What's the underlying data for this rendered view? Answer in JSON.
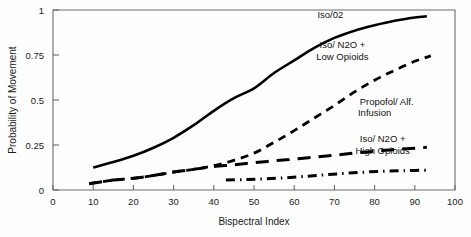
{
  "chart_data": {
    "type": "line",
    "title": "",
    "xlabel": "Bispectral Index",
    "ylabel": "Probability of Movement",
    "xlim": [
      0,
      100
    ],
    "ylim": [
      0,
      1
    ],
    "xticks": [
      0,
      10,
      20,
      30,
      40,
      50,
      60,
      70,
      80,
      90,
      100
    ],
    "xticklabels": [
      "0",
      "10",
      "20",
      "30",
      "40",
      "50",
      "60",
      "70",
      "80",
      "90",
      "100"
    ],
    "yticks": [
      0,
      0.25,
      0.5,
      0.75,
      1
    ],
    "yticklabels": [
      "0",
      "0.25",
      "0.5",
      "0.75",
      "1"
    ],
    "grid": false,
    "legend": "inline-annotations",
    "series": [
      {
        "name": "Iso/02",
        "linestyle": "solid",
        "color": "#000000",
        "label_lines": [
          "Iso/02"
        ],
        "x": [
          10,
          15,
          20,
          25,
          30,
          35,
          40,
          45,
          50,
          55,
          60,
          65,
          70,
          75,
          80,
          85,
          90,
          93
        ],
        "y": [
          0.125,
          0.155,
          0.19,
          0.235,
          0.29,
          0.36,
          0.44,
          0.51,
          0.565,
          0.65,
          0.72,
          0.79,
          0.845,
          0.885,
          0.915,
          0.94,
          0.958,
          0.965
        ]
      },
      {
        "name": "Iso/ N2O + Low Opioids",
        "linestyle": "dashed",
        "color": "#000000",
        "label_lines": [
          "Iso/ N2O +",
          "Low Opioids"
        ],
        "x": [
          9,
          15,
          20,
          25,
          30,
          35,
          40,
          45,
          50,
          55,
          60,
          65,
          70,
          75,
          80,
          85,
          90,
          94
        ],
        "y": [
          0.035,
          0.055,
          0.065,
          0.08,
          0.1,
          0.115,
          0.135,
          0.165,
          0.205,
          0.265,
          0.33,
          0.4,
          0.47,
          0.545,
          0.61,
          0.665,
          0.715,
          0.745
        ]
      },
      {
        "name": "Propofol/ Alf. Infusion",
        "linestyle": "longdash",
        "color": "#000000",
        "label_lines": [
          "Propofol/ Alf.",
          "Infusion"
        ],
        "x": [
          9,
          15,
          20,
          25,
          30,
          35,
          40,
          45,
          50,
          55,
          60,
          65,
          70,
          75,
          80,
          85,
          90,
          93
        ],
        "y": [
          0.035,
          0.055,
          0.065,
          0.08,
          0.1,
          0.115,
          0.13,
          0.14,
          0.152,
          0.162,
          0.172,
          0.182,
          0.193,
          0.205,
          0.215,
          0.225,
          0.232,
          0.237
        ]
      },
      {
        "name": "Iso/ N2O + High Opioids",
        "linestyle": "dashdot",
        "color": "#000000",
        "label_lines": [
          "Iso/ N2O +",
          "High Opioids"
        ],
        "x": [
          43,
          48,
          53,
          58,
          63,
          68,
          73,
          78,
          83,
          88,
          93
        ],
        "y": [
          0.055,
          0.058,
          0.062,
          0.068,
          0.076,
          0.085,
          0.093,
          0.1,
          0.105,
          0.108,
          0.11
        ]
      }
    ],
    "annotations": [
      {
        "text": "Iso/02",
        "x": 69,
        "y": 0.955
      },
      {
        "text": "Iso/ N2O +",
        "x": 72,
        "y": 0.79
      },
      {
        "text": "Low Opioids",
        "x": 72,
        "y": 0.725
      },
      {
        "text": "Propofol/ Alf.",
        "x": 83,
        "y": 0.475
      },
      {
        "text": "Infusion",
        "x": 80,
        "y": 0.41
      },
      {
        "text": "Iso/ N2O +",
        "x": 82,
        "y": 0.265
      },
      {
        "text": "High Opioids",
        "x": 82,
        "y": 0.2
      }
    ]
  }
}
